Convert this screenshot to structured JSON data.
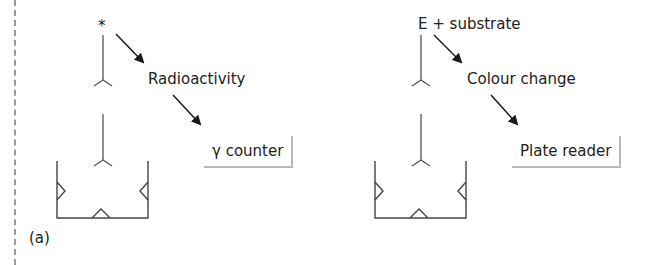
{
  "panel_label": "(a)",
  "left_scheme": {
    "label_marker": "*",
    "step1": "Radioactivity",
    "detector": "γ counter"
  },
  "right_scheme": {
    "label_marker": "E + substrate",
    "step1": "Colour change",
    "detector": "Plate reader"
  },
  "colors": {
    "line": "#555555",
    "arrow": "#1a1a1a",
    "box_shadow": "#b9b9b9",
    "border_dashed": "#9a9a9a"
  }
}
